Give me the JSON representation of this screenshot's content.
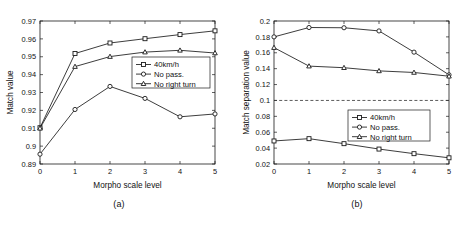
{
  "figure": {
    "background": "#ffffff",
    "line_color": "#1a1a1a",
    "threshold_color": "#333333"
  },
  "panels": [
    {
      "id": "a",
      "caption": "(a)",
      "ylabel": "Match value",
      "xlabel": "Morpho scale level",
      "legend_position": "center-right"
    },
    {
      "id": "b",
      "caption": "(b)",
      "ylabel": "Match separation value",
      "xlabel": "Morpho scale level",
      "legend_position": "center-right"
    }
  ],
  "legend": {
    "entries": [
      {
        "label": "40km/h",
        "marker": "square"
      },
      {
        "label": "No pass.",
        "marker": "circle"
      },
      {
        "label": "No right turn",
        "marker": "triangle"
      }
    ]
  },
  "chart_data": [
    {
      "type": "line",
      "title": "(a)",
      "xlabel": "Morpho scale level",
      "ylabel": "Match value",
      "x": [
        0,
        1,
        2,
        3,
        4,
        5
      ],
      "xticklabels": [
        "0",
        "1",
        "2",
        "3",
        "4",
        "5"
      ],
      "xlim": [
        0,
        5
      ],
      "ylim": [
        0.89,
        0.97
      ],
      "yticks": [
        0.89,
        0.9,
        0.91,
        0.92,
        0.93,
        0.94,
        0.95,
        0.96,
        0.97
      ],
      "yticklabels": [
        "0.89",
        "0.9",
        "0.91",
        "0.92",
        "0.93",
        "0.94",
        "0.95",
        "0.96",
        "0.97"
      ],
      "grid": false,
      "legend": [
        "40km/h",
        "No pass.",
        "No right turn"
      ],
      "legend_position": "center right",
      "series": [
        {
          "name": "40km/h",
          "marker": "square",
          "values": [
            0.9103,
            0.9518,
            0.9577,
            0.9601,
            0.9624,
            0.9645
          ]
        },
        {
          "name": "No pass.",
          "marker": "circle",
          "values": [
            0.8955,
            0.9205,
            0.9334,
            0.9267,
            0.9164,
            0.918
          ]
        },
        {
          "name": "No right turn",
          "marker": "triangle",
          "values": [
            0.91,
            0.9445,
            0.9501,
            0.9526,
            0.9536,
            0.9521
          ]
        }
      ]
    },
    {
      "type": "line",
      "title": "(b)",
      "xlabel": "Morpho scale level",
      "ylabel": "Match separation value",
      "x": [
        0,
        1,
        2,
        3,
        4,
        5
      ],
      "xticklabels": [
        "0",
        "1",
        "2",
        "3",
        "4",
        "5"
      ],
      "xlim": [
        0,
        5
      ],
      "ylim": [
        0.02,
        0.2
      ],
      "yticks": [
        0.02,
        0.04,
        0.06,
        0.08,
        0.1,
        0.12,
        0.14,
        0.16,
        0.18,
        0.2
      ],
      "yticklabels": [
        "0.02",
        "0.04",
        "0.06",
        "0.08",
        "0.1",
        "0.12",
        "0.14",
        "0.16",
        "0.18",
        "0.2"
      ],
      "grid": false,
      "legend": [
        "40km/h",
        "No pass.",
        "No right turn"
      ],
      "legend_position": "center right",
      "threshold_line": {
        "value": 0.1,
        "style": "dashed"
      },
      "series": [
        {
          "name": "40km/h",
          "marker": "square",
          "values": [
            0.049,
            0.0519,
            0.0456,
            0.0388,
            0.033,
            0.0278
          ]
        },
        {
          "name": "No pass.",
          "marker": "circle",
          "values": [
            0.18,
            0.1918,
            0.1915,
            0.1875,
            0.1608,
            0.1322
          ]
        },
        {
          "name": "No right turn",
          "marker": "triangle",
          "values": [
            0.1665,
            0.1432,
            0.1412,
            0.1372,
            0.1352,
            0.1305
          ]
        }
      ]
    }
  ]
}
